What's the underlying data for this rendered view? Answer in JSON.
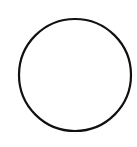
{
  "shape": {
    "type": "circle",
    "cx": 75,
    "cy": 75,
    "r": 56,
    "stroke_color": "#111111",
    "stroke_width": 2.2,
    "fill_color": "#ffffff"
  },
  "background_color": "#ffffff"
}
